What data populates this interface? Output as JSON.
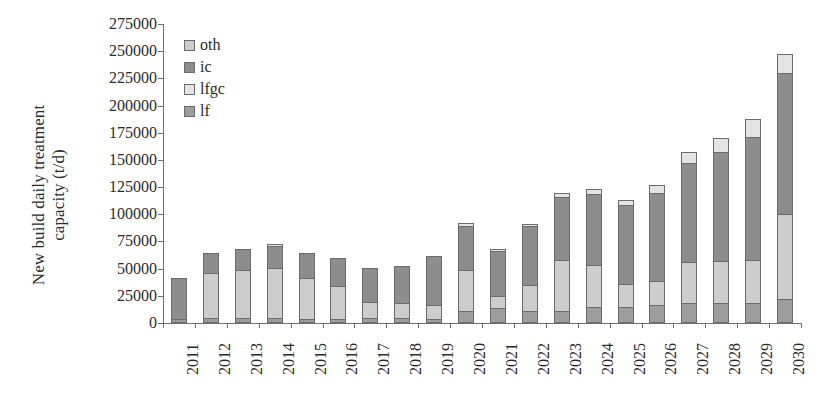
{
  "chart_data": {
    "type": "bar",
    "stacked": true,
    "title": "",
    "xlabel": "",
    "ylabel": "New build daily treatment\ncapacity (t/d)",
    "ylim": [
      0,
      275000
    ],
    "ytick_step": 25000,
    "ytick_labels": [
      "0",
      "25000",
      "50000",
      "75000",
      "100000",
      "125000",
      "150000",
      "175000",
      "200000",
      "225000",
      "250000",
      "275000"
    ],
    "grid": false,
    "legend_position": "top-left",
    "categories": [
      "2011",
      "2012",
      "2013",
      "2014",
      "2015",
      "2016",
      "2017",
      "2018",
      "2019",
      "2020",
      "2021",
      "2022",
      "2023",
      "2024",
      "2025",
      "2026",
      "2027",
      "2028",
      "2029",
      "2030"
    ],
    "series": [
      {
        "name": "lf",
        "color": "#9d9d9d",
        "values": [
          0,
          3000,
          3000,
          3000,
          2000,
          2000,
          3000,
          3000,
          2000,
          9000,
          12000,
          9000,
          9000,
          13000,
          13000,
          15000,
          17000,
          17000,
          17000,
          20000
        ]
      },
      {
        "name": "lfgc",
        "color": "#d8d8d8",
        "values": [
          0,
          0,
          0,
          0,
          0,
          0,
          0,
          0,
          0,
          0,
          0,
          0,
          0,
          0,
          0,
          0,
          0,
          0,
          0,
          0
        ]
      },
      {
        "name": "ic",
        "color": "#8d8d8d",
        "values": [
          41000,
          19000,
          20000,
          21000,
          21000,
          23000,
          25000,
          25000,
          27000,
          43000,
          42000,
          48000,
          62000,
          68000,
          64000,
          70000,
          97000,
          110000,
          119000,
          140000
        ]
      },
      {
        "name": "oth",
        "color": "#cdcdcd",
        "values": [
          0,
          42000,
          45000,
          49000,
          41000,
          35000,
          23000,
          24000,
          33000,
          40000,
          14000,
          34000,
          49000,
          42000,
          36000,
          42000,
          43000,
          43000,
          52000,
          87000
        ]
      }
    ],
    "series_stack_order": [
      "lf",
      "oth",
      "ic",
      "lfgc"
    ],
    "totals": [
      41000,
      64000,
      68000,
      73000,
      64000,
      60000,
      51000,
      52000,
      62000,
      92000,
      68000,
      91000,
      120000,
      123000,
      113000,
      127000,
      157000,
      170000,
      188000,
      247000
    ],
    "legend": [
      {
        "label": "oth",
        "color": "#cdcdcd"
      },
      {
        "label": "ic",
        "color": "#8d8d8d"
      },
      {
        "label": "lfgc",
        "color": "#e4e4e4"
      },
      {
        "label": "lf",
        "color": "#9d9d9d"
      }
    ],
    "stack_segments": [
      {
        "year": "2011",
        "parts": [
          {
            "s": "lf",
            "v": 1500,
            "c": "#9d9d9d"
          },
          {
            "s": "oth",
            "v": 0,
            "c": "#cdcdcd"
          },
          {
            "s": "ic",
            "v": 39500,
            "c": "#8d8d8d"
          },
          {
            "s": "lfgc",
            "v": 0,
            "c": "#e4e4e4"
          }
        ]
      },
      {
        "year": "2012",
        "parts": [
          {
            "s": "lf",
            "v": 3000,
            "c": "#9d9d9d"
          },
          {
            "s": "oth",
            "v": 42000,
            "c": "#cdcdcd"
          },
          {
            "s": "ic",
            "v": 19000,
            "c": "#8d8d8d"
          },
          {
            "s": "lfgc",
            "v": 0,
            "c": "#e4e4e4"
          }
        ]
      },
      {
        "year": "2013",
        "parts": [
          {
            "s": "lf",
            "v": 3000,
            "c": "#9d9d9d"
          },
          {
            "s": "oth",
            "v": 45000,
            "c": "#cdcdcd"
          },
          {
            "s": "ic",
            "v": 20000,
            "c": "#8d8d8d"
          },
          {
            "s": "lfgc",
            "v": 0,
            "c": "#e4e4e4"
          }
        ]
      },
      {
        "year": "2014",
        "parts": [
          {
            "s": "lf",
            "v": 3000,
            "c": "#9d9d9d"
          },
          {
            "s": "oth",
            "v": 47000,
            "c": "#cdcdcd"
          },
          {
            "s": "ic",
            "v": 21000,
            "c": "#8d8d8d"
          },
          {
            "s": "lfgc",
            "v": 2000,
            "c": "#e4e4e4"
          }
        ]
      },
      {
        "year": "2015",
        "parts": [
          {
            "s": "lf",
            "v": 2000,
            "c": "#9d9d9d"
          },
          {
            "s": "oth",
            "v": 39000,
            "c": "#cdcdcd"
          },
          {
            "s": "ic",
            "v": 23000,
            "c": "#8d8d8d"
          },
          {
            "s": "lfgc",
            "v": 0,
            "c": "#e4e4e4"
          }
        ]
      },
      {
        "year": "2016",
        "parts": [
          {
            "s": "lf",
            "v": 2000,
            "c": "#9d9d9d"
          },
          {
            "s": "oth",
            "v": 31000,
            "c": "#cdcdcd"
          },
          {
            "s": "ic",
            "v": 27000,
            "c": "#8d8d8d"
          },
          {
            "s": "lfgc",
            "v": 0,
            "c": "#e4e4e4"
          }
        ]
      },
      {
        "year": "2017",
        "parts": [
          {
            "s": "lf",
            "v": 3000,
            "c": "#9d9d9d"
          },
          {
            "s": "oth",
            "v": 15000,
            "c": "#cdcdcd"
          },
          {
            "s": "ic",
            "v": 33000,
            "c": "#8d8d8d"
          },
          {
            "s": "lfgc",
            "v": 0,
            "c": "#e4e4e4"
          }
        ]
      },
      {
        "year": "2018",
        "parts": [
          {
            "s": "lf",
            "v": 3000,
            "c": "#9d9d9d"
          },
          {
            "s": "oth",
            "v": 14000,
            "c": "#cdcdcd"
          },
          {
            "s": "ic",
            "v": 35000,
            "c": "#8d8d8d"
          },
          {
            "s": "lfgc",
            "v": 0,
            "c": "#e4e4e4"
          }
        ]
      },
      {
        "year": "2019",
        "parts": [
          {
            "s": "lf",
            "v": 2000,
            "c": "#9d9d9d"
          },
          {
            "s": "oth",
            "v": 13000,
            "c": "#cdcdcd"
          },
          {
            "s": "ic",
            "v": 47000,
            "c": "#8d8d8d"
          },
          {
            "s": "lfgc",
            "v": 0,
            "c": "#e4e4e4"
          }
        ]
      },
      {
        "year": "2020",
        "parts": [
          {
            "s": "lf",
            "v": 9000,
            "c": "#9d9d9d"
          },
          {
            "s": "oth",
            "v": 39000,
            "c": "#cdcdcd"
          },
          {
            "s": "ic",
            "v": 41000,
            "c": "#8d8d8d"
          },
          {
            "s": "lfgc",
            "v": 3000,
            "c": "#e4e4e4"
          }
        ]
      },
      {
        "year": "2021",
        "parts": [
          {
            "s": "lf",
            "v": 12000,
            "c": "#9d9d9d"
          },
          {
            "s": "oth",
            "v": 12000,
            "c": "#cdcdcd"
          },
          {
            "s": "ic",
            "v": 42000,
            "c": "#8d8d8d"
          },
          {
            "s": "lfgc",
            "v": 2000,
            "c": "#e4e4e4"
          }
        ]
      },
      {
        "year": "2022",
        "parts": [
          {
            "s": "lf",
            "v": 9000,
            "c": "#9d9d9d"
          },
          {
            "s": "oth",
            "v": 25000,
            "c": "#cdcdcd"
          },
          {
            "s": "ic",
            "v": 55000,
            "c": "#8d8d8d"
          },
          {
            "s": "lfgc",
            "v": 2000,
            "c": "#e4e4e4"
          }
        ]
      },
      {
        "year": "2023",
        "parts": [
          {
            "s": "lf",
            "v": 9000,
            "c": "#9d9d9d"
          },
          {
            "s": "oth",
            "v": 48000,
            "c": "#cdcdcd"
          },
          {
            "s": "ic",
            "v": 59000,
            "c": "#8d8d8d"
          },
          {
            "s": "lfgc",
            "v": 4000,
            "c": "#e4e4e4"
          }
        ]
      },
      {
        "year": "2024",
        "parts": [
          {
            "s": "lf",
            "v": 13000,
            "c": "#9d9d9d"
          },
          {
            "s": "oth",
            "v": 39000,
            "c": "#cdcdcd"
          },
          {
            "s": "ic",
            "v": 67000,
            "c": "#8d8d8d"
          },
          {
            "s": "lfgc",
            "v": 4000,
            "c": "#e4e4e4"
          }
        ]
      },
      {
        "year": "2025",
        "parts": [
          {
            "s": "lf",
            "v": 13000,
            "c": "#9d9d9d"
          },
          {
            "s": "oth",
            "v": 22000,
            "c": "#cdcdcd"
          },
          {
            "s": "ic",
            "v": 73000,
            "c": "#8d8d8d"
          },
          {
            "s": "lfgc",
            "v": 5000,
            "c": "#e4e4e4"
          }
        ]
      },
      {
        "year": "2026",
        "parts": [
          {
            "s": "lf",
            "v": 15000,
            "c": "#9d9d9d"
          },
          {
            "s": "oth",
            "v": 22000,
            "c": "#cdcdcd"
          },
          {
            "s": "ic",
            "v": 82000,
            "c": "#8d8d8d"
          },
          {
            "s": "lfgc",
            "v": 8000,
            "c": "#e4e4e4"
          }
        ]
      },
      {
        "year": "2027",
        "parts": [
          {
            "s": "lf",
            "v": 17000,
            "c": "#9d9d9d"
          },
          {
            "s": "oth",
            "v": 38000,
            "c": "#cdcdcd"
          },
          {
            "s": "ic",
            "v": 92000,
            "c": "#8d8d8d"
          },
          {
            "s": "lfgc",
            "v": 10000,
            "c": "#e4e4e4"
          }
        ]
      },
      {
        "year": "2028",
        "parts": [
          {
            "s": "lf",
            "v": 17000,
            "c": "#9d9d9d"
          },
          {
            "s": "oth",
            "v": 39000,
            "c": "#cdcdcd"
          },
          {
            "s": "ic",
            "v": 101000,
            "c": "#8d8d8d"
          },
          {
            "s": "lfgc",
            "v": 13000,
            "c": "#e4e4e4"
          }
        ]
      },
      {
        "year": "2029",
        "parts": [
          {
            "s": "lf",
            "v": 17000,
            "c": "#9d9d9d"
          },
          {
            "s": "oth",
            "v": 40000,
            "c": "#cdcdcd"
          },
          {
            "s": "ic",
            "v": 114000,
            "c": "#8d8d8d"
          },
          {
            "s": "lfgc",
            "v": 17000,
            "c": "#e4e4e4"
          }
        ]
      },
      {
        "year": "2030",
        "parts": [
          {
            "s": "lf",
            "v": 20000,
            "c": "#9d9d9d"
          },
          {
            "s": "oth",
            "v": 79000,
            "c": "#cdcdcd"
          },
          {
            "s": "ic",
            "v": 131000,
            "c": "#8d8d8d"
          },
          {
            "s": "lfgc",
            "v": 17000,
            "c": "#e4e4e4"
          }
        ]
      }
    ]
  }
}
